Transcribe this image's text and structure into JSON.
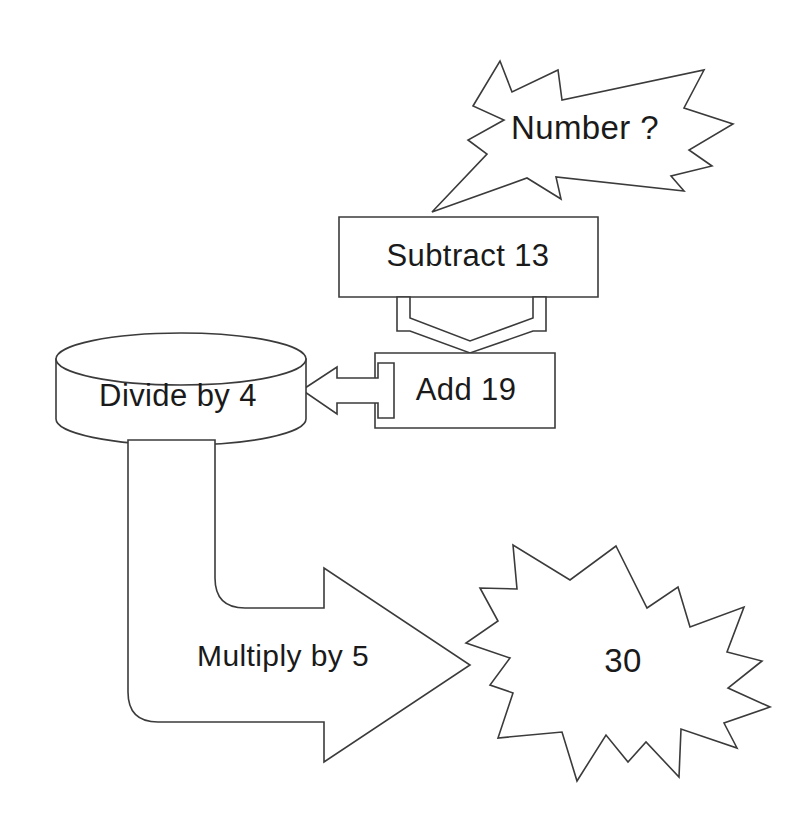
{
  "diagram": {
    "background_color": "#ffffff",
    "stroke_color": "#3b3b3b",
    "text_color": "#1a1a1a",
    "nodes": [
      {
        "id": "input-callout",
        "shape": "explosion-callout",
        "label": "Number ?"
      },
      {
        "id": "subtract-box",
        "shape": "rectangle",
        "label": "Subtract 13"
      },
      {
        "id": "add-box",
        "shape": "rectangle",
        "label": "Add 19"
      },
      {
        "id": "divide-cylinder",
        "shape": "cylinder",
        "label": "Divide by 4"
      },
      {
        "id": "multiply-arrow",
        "shape": "bent-block-arrow",
        "label": "Multiply by 5"
      },
      {
        "id": "result-star",
        "shape": "starburst",
        "label": "30"
      }
    ],
    "connectors": [
      {
        "id": "callout-tail",
        "from": "input-callout",
        "to": "subtract-box",
        "style": "callout-tail"
      },
      {
        "id": "subtract-to-add",
        "from": "subtract-box",
        "to": "add-box",
        "style": "down-chevron-arrow"
      },
      {
        "id": "add-to-divide",
        "from": "add-box",
        "to": "divide-cylinder",
        "style": "left-block-arrow"
      },
      {
        "id": "divide-to-multiply",
        "from": "divide-cylinder",
        "to": "multiply-arrow",
        "style": "bent-arrow-body"
      },
      {
        "id": "multiply-to-star",
        "from": "multiply-arrow",
        "to": "result-star",
        "style": "arrow-head"
      }
    ]
  }
}
